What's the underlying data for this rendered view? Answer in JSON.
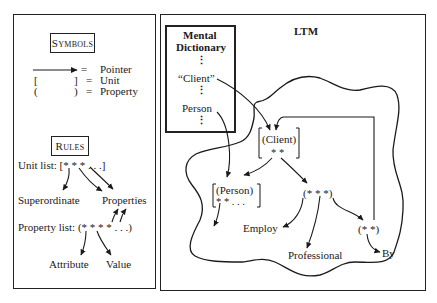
{
  "left_panel": {
    "symbols": {
      "title": "Symbols",
      "items": [
        {
          "symbol": "arrow",
          "eq": "=",
          "label": "Pointer"
        },
        {
          "symbol": "[   ]",
          "open": "[",
          "close": "]",
          "eq": "=",
          "label": "Unit"
        },
        {
          "symbol": "(   )",
          "open": "(",
          "close": ")",
          "eq": "=",
          "label": "Property"
        }
      ]
    },
    "rules": {
      "title": "Rules",
      "unit_list": "Unit list: [*  *  * . . .]",
      "superordinate": "Superordinate",
      "properties": "Properties",
      "property_list": "Property list: (*  *  *  * . . .)",
      "attribute": "Attribute",
      "value": "Value"
    }
  },
  "right_panel": {
    "title": "LTM",
    "dictionary": {
      "title_line1": "Mental",
      "title_line2": "Dictionary",
      "entries": [
        "“Client”",
        "Person"
      ],
      "ellipsis": "⋮"
    },
    "nodes": {
      "client_unit": "(Client)",
      "client_stars": "* *",
      "person_unit": "(Person)",
      "person_stars": "*  *   . . .",
      "prop_triple": "(*  *  *)",
      "prop_pair": "(*  *)",
      "employ": "Employ",
      "professional": "Professional",
      "by": "By"
    }
  }
}
